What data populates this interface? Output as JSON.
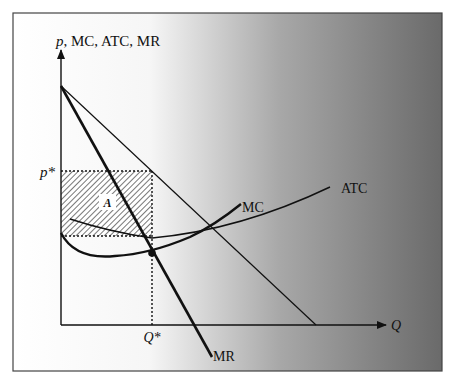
{
  "diagram": {
    "y_axis_label": "p, MC, ATC, MR",
    "y_axis_label_italic_part": "p",
    "y_axis_label_rest": ", MC, ATC, MR",
    "x_axis_label": "Q",
    "price_label": "p*",
    "quantity_label": "Q*",
    "area_label": "A",
    "curves": {
      "mc": "MC",
      "atc": "ATC",
      "mr": "MR",
      "demand": ""
    },
    "colors": {
      "frame": "#444444",
      "line": "#111111",
      "gradient_start": "#ffffff",
      "gradient_end": "#6e6e6e"
    }
  }
}
